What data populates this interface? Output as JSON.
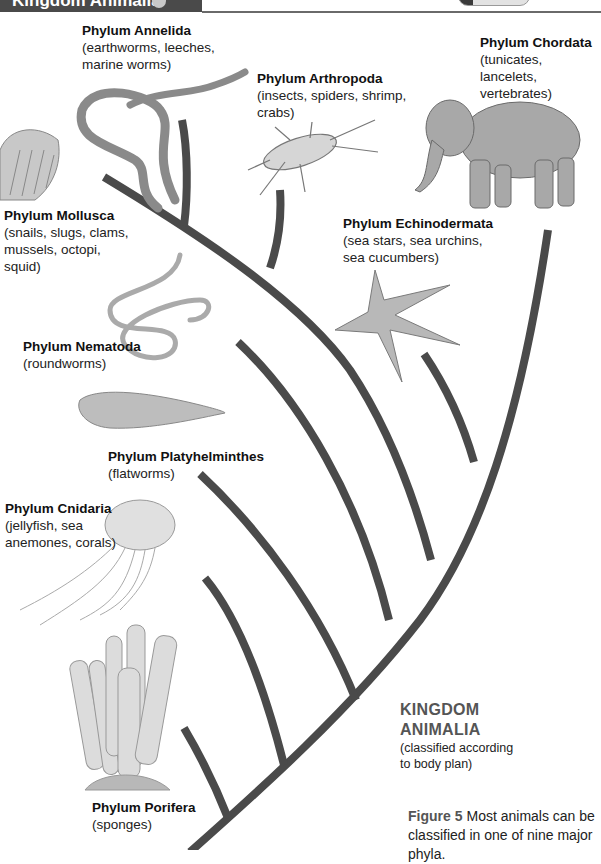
{
  "header": {
    "title": "Kingdom Animalia"
  },
  "phyla": [
    {
      "id": "annelida",
      "name": "Phylum Annelida",
      "desc_lines": [
        "(earthworms, leeches,",
        "marine worms)"
      ]
    },
    {
      "id": "arthropoda",
      "name": "Phylum Arthropoda",
      "desc_lines": [
        "(insects, spiders, shrimp,",
        "crabs)"
      ]
    },
    {
      "id": "chordata",
      "name": "Phylum Chordata",
      "desc_lines": [
        "(tunicates, lancelets,",
        "vertebrates)"
      ]
    },
    {
      "id": "mollusca",
      "name": "Phylum Mollusca",
      "desc_lines": [
        "(snails, slugs, clams,",
        "mussels, octopi,",
        "squid)"
      ]
    },
    {
      "id": "echinodermata",
      "name": "Phylum Echinodermata",
      "desc_lines": [
        "(sea stars, sea urchins,",
        "sea cucumbers)"
      ]
    },
    {
      "id": "nematoda",
      "name": "Phylum Nematoda",
      "desc_lines": [
        "(roundworms)"
      ]
    },
    {
      "id": "platyhelminthes",
      "name": "Phylum Platyhelminthes",
      "desc_lines": [
        "(flatworms)"
      ]
    },
    {
      "id": "cnidaria",
      "name": "Phylum Cnidaria",
      "desc_lines": [
        "(jellyfish, sea",
        "anemones, corals)"
      ]
    },
    {
      "id": "porifera",
      "name": "Phylum Porifera",
      "desc_lines": [
        "(sponges)"
      ]
    }
  ],
  "kingdom": {
    "title_lines": [
      "KINGDOM",
      "ANIMALIA"
    ],
    "desc_lines": [
      "(classified according",
      "to body plan)"
    ]
  },
  "caption": {
    "figure_label": "Figure 5",
    "text": "Most animals can be classified in one of nine major phyla."
  },
  "illustrations": [
    "earthworm",
    "cockroach",
    "elephant",
    "scallop-shell",
    "sea-star",
    "roundworm",
    "flatworm",
    "jellyfish",
    "tube-sponge"
  ],
  "colors": {
    "branch": "#4a4a4a",
    "header_bg": "#4a4a4a",
    "kingdom_title": "#555555"
  }
}
